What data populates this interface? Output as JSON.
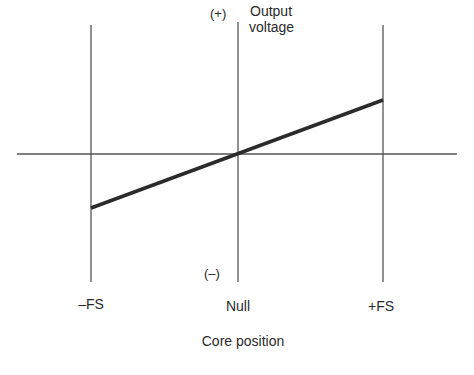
{
  "diagram": {
    "type": "transfer-characteristic",
    "y_axis": {
      "label_line1": "Output",
      "label_line2": "voltage",
      "positive_marker": "(+)",
      "negative_marker": "(–)"
    },
    "x_axis": {
      "label": "Core position",
      "ticks": [
        "–FS",
        "Null",
        "+FS"
      ]
    },
    "line": {
      "description": "linear output vs core position passing through null",
      "points": [
        {
          "x": "-FS",
          "y": -1
        },
        {
          "x": "Null",
          "y": 0
        },
        {
          "x": "+FS",
          "y": 1
        }
      ]
    },
    "colors": {
      "line": "#2b2b2b",
      "axis": "#4a4a4a",
      "background": "#ffffff"
    }
  }
}
